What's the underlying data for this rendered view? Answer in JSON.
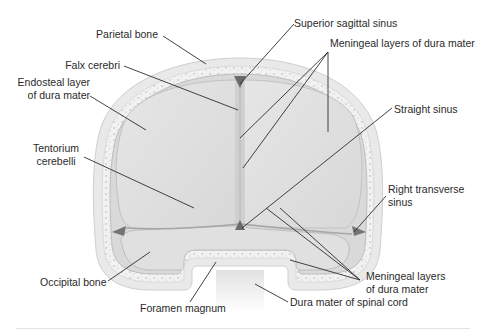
{
  "figure": {
    "colors": {
      "bone_outer": "#e8e8e8",
      "bone_spongy": "#f3f3f3",
      "dura": "#d6d6d6",
      "brain_compartment": "#dedede",
      "sinus": "#6e6e6e",
      "leader_line": "#2e2e2e",
      "text": "#2a2a2a"
    }
  },
  "labels": {
    "parietal_bone": "Parietal bone",
    "falx_cerebri": "Falx cerebri",
    "endosteal_layer_line1": "Endosteal layer",
    "endosteal_layer_line2": "of dura mater",
    "tentorium_line1": "Tentorium",
    "tentorium_line2": "cerebelli",
    "occipital_bone": "Occipital bone",
    "foramen_magnum": "Foramen magnum",
    "superior_sagittal_sinus": "Superior sagittal sinus",
    "meningeal_layers_top": "Meningeal layers of dura mater",
    "straight_sinus": "Straight sinus",
    "right_transverse_line1": "Right transverse",
    "right_transverse_line2": "sinus",
    "meningeal_layers_bottom_line1": "Meningeal layers",
    "meningeal_layers_bottom_line2": "of dura mater",
    "dura_spinal_cord": "Dura mater of spinal cord"
  }
}
